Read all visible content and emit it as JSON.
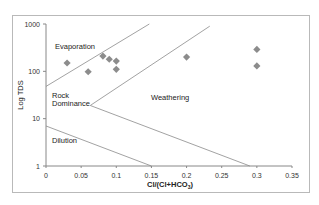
{
  "chart_data": {
    "type": "scatter",
    "title": "",
    "xlabel": "Cl/(Cl+HCO3)",
    "xlabel_main": "Cl/(Cl+HCO",
    "xlabel_sub": "3",
    "xlabel_close": ")",
    "ylabel": "Log TDS",
    "xlim": [
      0,
      0.35
    ],
    "ylim": [
      1,
      1000
    ],
    "yscale": "log",
    "x_ticks": [
      "0",
      "0.05",
      "0.1",
      "0.15",
      "0.2",
      "0.25",
      "0.3",
      "0.35"
    ],
    "y_ticks": [
      "1",
      "10",
      "100",
      "1000"
    ],
    "grid": false,
    "legend": null,
    "series": [
      {
        "name": "Samples",
        "marker": "diamond",
        "color": "#8c8c8c",
        "points": [
          {
            "x": 0.03,
            "y": 150
          },
          {
            "x": 0.06,
            "y": 98
          },
          {
            "x": 0.081,
            "y": 210
          },
          {
            "x": 0.09,
            "y": 180
          },
          {
            "x": 0.1,
            "y": 165
          },
          {
            "x": 0.1,
            "y": 110
          },
          {
            "x": 0.2,
            "y": 200
          },
          {
            "x": 0.3,
            "y": 290
          },
          {
            "x": 0.3,
            "y": 130
          }
        ]
      }
    ],
    "annotations": [
      {
        "text": "Evaporation"
      },
      {
        "text": "Rock"
      },
      {
        "text": "Dominance"
      },
      {
        "text": "Weathering"
      },
      {
        "text": "Dilution"
      }
    ],
    "boundary_lines": [
      {
        "name": "evaporation-upper",
        "from": {
          "x": 0.0,
          "y": 48
        },
        "to": {
          "x": 0.147,
          "y": 1000
        }
      },
      {
        "name": "evaporation-lower",
        "from": {
          "x": 0.063,
          "y": 19
        },
        "to": {
          "x": 0.233,
          "y": 900
        }
      },
      {
        "name": "weathering-lower",
        "from": {
          "x": 0.063,
          "y": 19
        },
        "to": {
          "x": 0.29,
          "y": 1
        }
      },
      {
        "name": "dilution",
        "from": {
          "x": 0.0,
          "y": 7
        },
        "to": {
          "x": 0.15,
          "y": 1
        }
      }
    ]
  }
}
